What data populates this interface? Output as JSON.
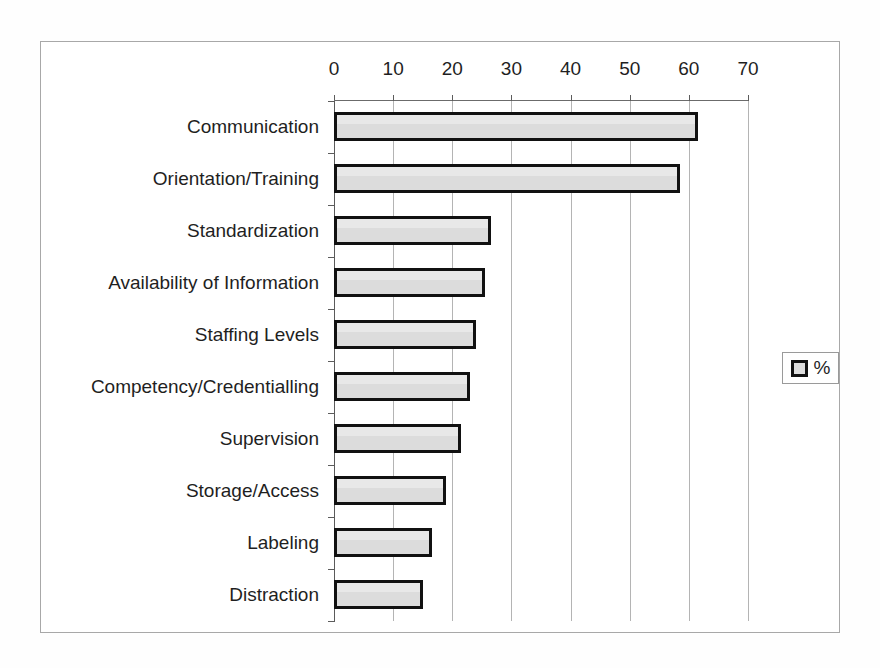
{
  "chart_data": {
    "type": "bar",
    "orientation": "horizontal",
    "title": "",
    "subtitle": "",
    "xlabel": "",
    "ylabel": "",
    "categories": [
      "Communication",
      "Orientation/Training",
      "Standardization",
      "Availability of Information",
      "Staffing Levels",
      "Competency/Credentialling",
      "Supervision",
      "Storage/Access",
      "Labeling",
      "Distraction"
    ],
    "series": [
      {
        "name": "%",
        "values": [
          61.5,
          58.5,
          26.5,
          25.5,
          24.0,
          23.0,
          21.5,
          19.0,
          16.5,
          15.0
        ]
      }
    ],
    "values": [
      61.5,
      58.5,
      26.5,
      25.5,
      24.0,
      23.0,
      21.5,
      19.0,
      16.5,
      15.0
    ],
    "xlim": [
      0,
      70
    ],
    "xticks": [
      0,
      10,
      20,
      30,
      40,
      50,
      60,
      70
    ],
    "xtick_labels": [
      "0",
      "10",
      "20",
      "30",
      "40",
      "50",
      "60",
      "70"
    ],
    "grid": "vertical",
    "legend": {
      "position": "right",
      "entries": [
        {
          "label": "%",
          "swatch_color": "#dcdcdc",
          "swatch_border": "#111111"
        }
      ]
    },
    "colors": {
      "bar_fill": "#dcdcdc",
      "bar_border": "#111111",
      "gridline": "#b4b4b4",
      "axis": "#5c5c5c",
      "frame": "#a8a8a8",
      "background": "#ffffff",
      "text": "#1f1f1f"
    }
  }
}
